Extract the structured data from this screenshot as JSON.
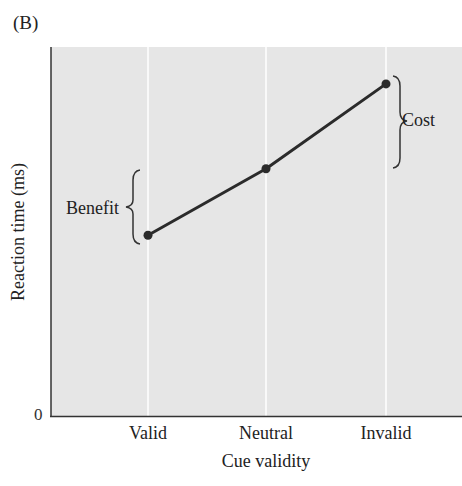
{
  "panel_label": "(B)",
  "chart_data": {
    "type": "line",
    "title": "",
    "xlabel": "Cue validity",
    "ylabel": "Reaction time (ms)",
    "categories": [
      "Valid",
      "Neutral",
      "Invalid"
    ],
    "series": [
      {
        "name": "Reaction time",
        "values": [
          49,
          67,
          90
        ]
      }
    ],
    "value_units": "relative (arbitrary units, axis only labeled at 0)",
    "y_tick_labels": [
      "0"
    ],
    "ylim": [
      0,
      100
    ],
    "grid": {
      "vertical": true,
      "horizontal": false,
      "color": "#ffffff"
    },
    "legend": null,
    "annotations": [
      {
        "label": "Benefit",
        "type": "brace",
        "spans": [
          "Valid",
          "Neutral"
        ],
        "side": "left-of-Valid"
      },
      {
        "label": "Cost",
        "type": "brace",
        "spans": [
          "Neutral",
          "Invalid"
        ],
        "side": "right-of-Invalid"
      }
    ],
    "colors": {
      "plot_background": "#e6e6e6",
      "line": "#2b2b2b",
      "marker": "#2b2b2b",
      "axis": "#333333"
    }
  },
  "axis": {
    "zero_tick": "0"
  }
}
